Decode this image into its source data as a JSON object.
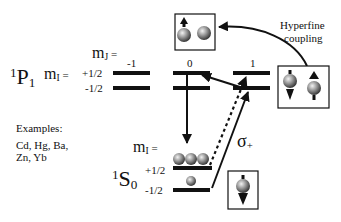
{
  "upper_state": {
    "term_sup": "1",
    "term_letter": "P",
    "term_sub": "1",
    "mI_label": "m",
    "mI_sub": "I",
    "mI_eq": " =",
    "mI_values": [
      "+1/2",
      "-1/2"
    ],
    "mJ_label": "m",
    "mJ_sub": "J",
    "mJ_eq": " =",
    "mJ_values": [
      "-1",
      "0",
      "1"
    ]
  },
  "lower_state": {
    "term_sup": "1",
    "term_letter": "S",
    "term_sub": "0",
    "mI_label": "m",
    "mI_sub": "I",
    "mI_eq": " =",
    "mI_values": [
      "+1/2",
      "-1/2"
    ]
  },
  "examples": {
    "title": "Examples:",
    "line1": "Cd, Hg, Ba,",
    "line2": "Zn, Yb"
  },
  "annotations": {
    "hyperfine_line1": "Hyperfine",
    "hyperfine_line2": "coupling",
    "sigma": "σ",
    "sigma_sub": "+"
  },
  "colors": {
    "ink": "#111111",
    "ball_light": "#e8e8e8",
    "ball_dark": "#3a3a3a"
  }
}
